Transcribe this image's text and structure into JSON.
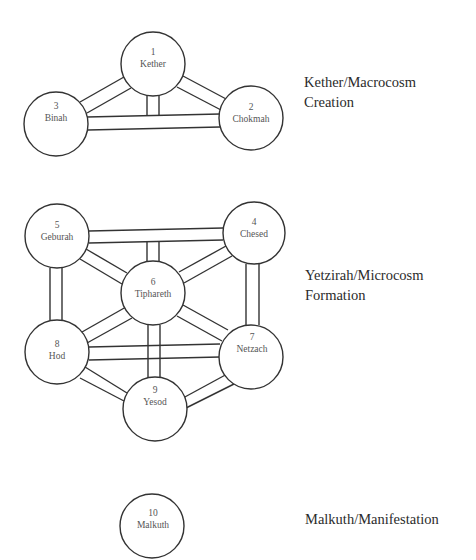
{
  "diagram": {
    "groups": [
      {
        "id": "macrocosm",
        "label_line1": "Kether/Macrocosm",
        "label_line2": "Creation",
        "nodes": [
          1,
          2,
          3
        ]
      },
      {
        "id": "microcosm",
        "label_line1": "Yetzirah/Microcosm",
        "label_line2": "Formation",
        "nodes": [
          4,
          5,
          6,
          7,
          8,
          9
        ]
      },
      {
        "id": "manifestation",
        "label_line1": "Malkuth/Manifestation",
        "label_line2": "",
        "nodes": [
          10
        ]
      }
    ],
    "nodes": [
      {
        "num": "1",
        "name": "Kether",
        "cx": 153,
        "cy": 64
      },
      {
        "num": "2",
        "name": "Chokmah",
        "cx": 251,
        "cy": 118
      },
      {
        "num": "3",
        "name": "Binah",
        "cx": 56,
        "cy": 124
      },
      {
        "num": "4",
        "name": "Chesed",
        "cx": 254,
        "cy": 233
      },
      {
        "num": "5",
        "name": "Geburah",
        "cx": 57,
        "cy": 236
      },
      {
        "num": "6",
        "name": "Tiphareth",
        "cx": 153,
        "cy": 293
      },
      {
        "num": "7",
        "name": "Netzach",
        "cx": 251,
        "cy": 357
      },
      {
        "num": "8",
        "name": "Hod",
        "cx": 57,
        "cy": 352
      },
      {
        "num": "9",
        "name": "Yesod",
        "cx": 155,
        "cy": 409
      },
      {
        "num": "10",
        "name": "Malkuth",
        "cx": 152,
        "cy": 526
      }
    ],
    "paths": [
      [
        "1",
        "3"
      ],
      [
        "1",
        "2"
      ],
      [
        "3",
        "2"
      ],
      [
        "1",
        "3-2"
      ],
      [
        "5",
        "4"
      ],
      [
        "5",
        "6"
      ],
      [
        "4",
        "6"
      ],
      [
        "6",
        "5-4"
      ],
      [
        "5",
        "8"
      ],
      [
        "4",
        "7"
      ],
      [
        "6",
        "8"
      ],
      [
        "6",
        "7"
      ],
      [
        "8",
        "7"
      ],
      [
        "6",
        "9"
      ],
      [
        "8",
        "9"
      ],
      [
        "7",
        "9"
      ]
    ]
  }
}
